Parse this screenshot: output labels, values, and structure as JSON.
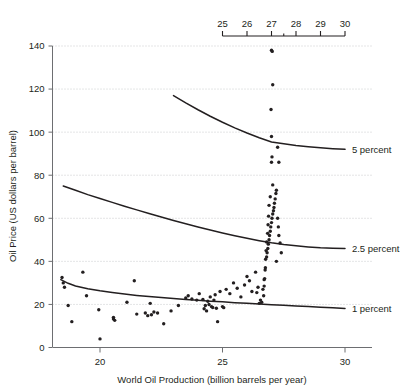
{
  "chart_data": {
    "type": "scatter",
    "title": "",
    "xlabel": "World Oil Production (billion barrels per year)",
    "ylabel": "Oil Price (US dollars per barrel)",
    "xlim": [
      18.2,
      30.6
    ],
    "ylim": [
      0,
      145
    ],
    "grid": true,
    "x_ticks": [
      20,
      25,
      30
    ],
    "x_tick_labels": [
      "20",
      "25",
      "30"
    ],
    "y_ticks": [
      0,
      20,
      40,
      60,
      80,
      100,
      120,
      140
    ],
    "y_tick_labels": [
      "0",
      "20",
      "40",
      "60",
      "80",
      "100",
      "120",
      "140"
    ],
    "secondary_xaxis": {
      "position": "top",
      "ticks": [
        25,
        26,
        27,
        27.5,
        28,
        29,
        30
      ],
      "tick_labels": [
        "25",
        "26",
        "27",
        "28",
        "29",
        "30"
      ],
      "labeled_ticks": [
        25,
        26,
        27,
        28,
        29,
        30
      ],
      "minor_ticks": [
        27.5
      ],
      "range": [
        25,
        30
      ]
    },
    "legend_position": "right-inline",
    "series": [
      {
        "name": "5 percent",
        "type": "line",
        "label": "5 percent",
        "label_x": 30.2,
        "label_y": 92,
        "points": [
          [
            23.0,
            117.0
          ],
          [
            23.5,
            113.6
          ],
          [
            24.0,
            110.4
          ],
          [
            24.5,
            107.4
          ],
          [
            25.0,
            104.6
          ],
          [
            25.5,
            102.0
          ],
          [
            26.0,
            99.6
          ],
          [
            26.5,
            97.4
          ],
          [
            27.0,
            95.4
          ],
          [
            27.5,
            94.6
          ],
          [
            28.0,
            93.8
          ],
          [
            28.5,
            93.2
          ],
          [
            29.0,
            92.7
          ],
          [
            29.5,
            92.3
          ],
          [
            30.0,
            92.0
          ]
        ]
      },
      {
        "name": "2.5 percent",
        "type": "line",
        "label": "2.5 percent",
        "label_x": 30.2,
        "label_y": 46,
        "points": [
          [
            18.5,
            75.0
          ],
          [
            19.0,
            73.0
          ],
          [
            19.5,
            71.0
          ],
          [
            20.0,
            69.2
          ],
          [
            20.5,
            67.4
          ],
          [
            21.0,
            65.6
          ],
          [
            21.5,
            63.9
          ],
          [
            22.0,
            62.2
          ],
          [
            22.5,
            60.6
          ],
          [
            23.0,
            59.0
          ],
          [
            23.5,
            57.5
          ],
          [
            24.0,
            56.0
          ],
          [
            24.5,
            54.6
          ],
          [
            25.0,
            53.2
          ],
          [
            25.5,
            51.9
          ],
          [
            26.0,
            50.7
          ],
          [
            26.5,
            49.6
          ],
          [
            27.0,
            48.6
          ],
          [
            27.5,
            47.8
          ],
          [
            28.0,
            47.2
          ],
          [
            28.5,
            46.7
          ],
          [
            29.0,
            46.3
          ],
          [
            29.5,
            46.1
          ],
          [
            30.0,
            46.0
          ]
        ]
      },
      {
        "name": "1 percent",
        "type": "line",
        "label": "1 percent",
        "label_x": 30.2,
        "label_y": 18,
        "points": [
          [
            18.4,
            31.5
          ],
          [
            18.7,
            29.8
          ],
          [
            19.0,
            28.6
          ],
          [
            19.5,
            27.3
          ],
          [
            20.0,
            26.3
          ],
          [
            20.5,
            25.5
          ],
          [
            21.0,
            24.8
          ],
          [
            21.5,
            24.2
          ],
          [
            22.0,
            23.7
          ],
          [
            22.5,
            23.2
          ],
          [
            23.0,
            22.7
          ],
          [
            23.5,
            22.3
          ],
          [
            24.0,
            21.9
          ],
          [
            24.5,
            21.5
          ],
          [
            25.0,
            21.2
          ],
          [
            25.5,
            20.8
          ],
          [
            26.0,
            20.5
          ],
          [
            26.5,
            20.2
          ],
          [
            27.0,
            19.9
          ],
          [
            27.5,
            19.6
          ],
          [
            28.0,
            19.3
          ],
          [
            28.5,
            19.0
          ],
          [
            29.0,
            18.7
          ],
          [
            29.5,
            18.4
          ],
          [
            30.0,
            18.1
          ]
        ]
      },
      {
        "name": "observations",
        "type": "scatter",
        "label": "",
        "points": [
          [
            18.45,
            32.5
          ],
          [
            18.5,
            30.0
          ],
          [
            18.55,
            28.0
          ],
          [
            18.7,
            19.5
          ],
          [
            18.85,
            12.0
          ],
          [
            19.3,
            35.0
          ],
          [
            19.45,
            24.0
          ],
          [
            19.95,
            17.5
          ],
          [
            20.0,
            4.0
          ],
          [
            20.55,
            14.0
          ],
          [
            20.6,
            12.6
          ],
          [
            20.55,
            13.2
          ],
          [
            21.1,
            21.0
          ],
          [
            21.4,
            31.0
          ],
          [
            21.5,
            15.5
          ],
          [
            21.85,
            16.0
          ],
          [
            21.95,
            14.8
          ],
          [
            22.05,
            20.5
          ],
          [
            22.1,
            15.2
          ],
          [
            22.2,
            16.5
          ],
          [
            22.35,
            16.0
          ],
          [
            22.6,
            11.0
          ],
          [
            22.9,
            17.0
          ],
          [
            23.2,
            19.5
          ],
          [
            23.5,
            23.0
          ],
          [
            23.6,
            24.0
          ],
          [
            23.75,
            22.5
          ],
          [
            23.95,
            22.0
          ],
          [
            24.05,
            25.0
          ],
          [
            24.2,
            22.3
          ],
          [
            24.25,
            18.0
          ],
          [
            24.3,
            19.5
          ],
          [
            24.35,
            17.0
          ],
          [
            24.4,
            21.5
          ],
          [
            24.45,
            20.0
          ],
          [
            24.5,
            23.5
          ],
          [
            24.55,
            19.0
          ],
          [
            24.6,
            18.6
          ],
          [
            24.65,
            22.0
          ],
          [
            24.7,
            24.5
          ],
          [
            24.75,
            18.2
          ],
          [
            24.8,
            12.0
          ],
          [
            24.9,
            26.0
          ],
          [
            25.0,
            19.0
          ],
          [
            25.05,
            18.5
          ],
          [
            25.15,
            27.0
          ],
          [
            25.3,
            25.0
          ],
          [
            25.45,
            30.0
          ],
          [
            25.6,
            27.5
          ],
          [
            25.75,
            23.5
          ],
          [
            25.9,
            29.0
          ],
          [
            26.0,
            33.0
          ],
          [
            26.1,
            31.0
          ],
          [
            26.2,
            26.0
          ],
          [
            26.35,
            35.0
          ],
          [
            26.4,
            25.5
          ],
          [
            26.45,
            28.0
          ],
          [
            26.5,
            20.5
          ],
          [
            26.55,
            22.0
          ],
          [
            26.6,
            21.0
          ],
          [
            26.65,
            27.0
          ],
          [
            26.7,
            31.5
          ],
          [
            26.75,
            37.0
          ],
          [
            26.8,
            42.0
          ],
          [
            26.82,
            44.0
          ],
          [
            26.85,
            46.0
          ],
          [
            26.87,
            48.0
          ],
          [
            26.9,
            50.0
          ],
          [
            26.92,
            52.0
          ],
          [
            26.95,
            54.0
          ],
          [
            26.97,
            56.0
          ],
          [
            27.0,
            58.0
          ],
          [
            27.02,
            60.0
          ],
          [
            27.05,
            62.0
          ],
          [
            27.08,
            63.5
          ],
          [
            27.1,
            65.0
          ],
          [
            27.12,
            67.0
          ],
          [
            27.15,
            69.0
          ],
          [
            27.18,
            71.5
          ],
          [
            27.2,
            73.0
          ],
          [
            27.05,
            75.5
          ],
          [
            26.95,
            70.0
          ],
          [
            26.9,
            66.0
          ],
          [
            26.88,
            61.0
          ],
          [
            26.86,
            57.0
          ],
          [
            26.84,
            53.0
          ],
          [
            26.8,
            49.0
          ],
          [
            26.78,
            45.0
          ],
          [
            26.76,
            41.0
          ],
          [
            26.74,
            36.0
          ],
          [
            26.72,
            32.0
          ],
          [
            26.7,
            28.5
          ],
          [
            26.68,
            24.0
          ],
          [
            27.3,
            86.0
          ],
          [
            27.0,
            86.0
          ],
          [
            27.02,
            88.5
          ],
          [
            27.25,
            93.0
          ],
          [
            27.0,
            98.0
          ],
          [
            26.98,
            110.5
          ],
          [
            27.05,
            122.0
          ],
          [
            27.0,
            138.0
          ],
          [
            27.03,
            137.5
          ],
          [
            27.35,
            48.5
          ],
          [
            27.3,
            52.0
          ],
          [
            27.28,
            56.0
          ],
          [
            27.25,
            60.0
          ],
          [
            27.4,
            44.0
          ],
          [
            27.2,
            40.0
          ]
        ]
      }
    ]
  }
}
